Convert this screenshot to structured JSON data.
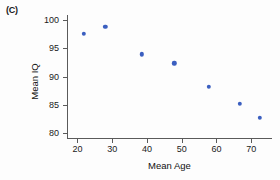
{
  "panel": {
    "label": "(C)"
  },
  "chart_data": {
    "type": "scatter",
    "title": "",
    "subtitle": "",
    "xlabel": "Mean Age",
    "ylabel": "Mean IQ",
    "xlim": [
      17,
      76
    ],
    "ylim": [
      79.2,
      100.8
    ],
    "xticks": [
      "20",
      "30",
      "40",
      "50",
      "60",
      "70"
    ],
    "xtick_values": [
      20,
      30,
      40,
      50,
      60,
      70
    ],
    "yticks": [
      "80",
      "85",
      "90",
      "95",
      "100"
    ],
    "ytick_values": [
      80,
      85,
      90,
      95,
      100
    ],
    "grid": false,
    "legend": false,
    "legend_position": "none",
    "marker_color": "#3b5fc0",
    "axis_color": "#5a5a5a",
    "background_color": "#fdfdfd",
    "series": [
      {
        "name": "Mean IQ by Mean Age",
        "x": [
          21.9,
          28.0,
          38.5,
          47.9,
          57.8,
          66.7,
          72.5
        ],
        "y": [
          97.5,
          98.7,
          93.9,
          92.3,
          88.2,
          85.2,
          82.7
        ]
      }
    ]
  }
}
